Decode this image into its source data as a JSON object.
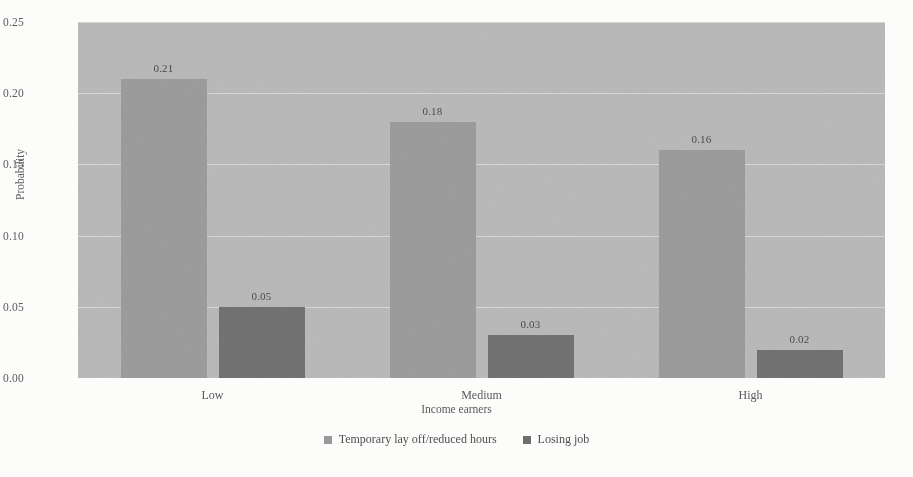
{
  "chart_data": {
    "type": "bar",
    "title": "",
    "subtitle": "",
    "xlabel": "Income earners",
    "ylabel": "Probability",
    "categories": [
      "Low",
      "Medium",
      "High"
    ],
    "series": [
      {
        "name": "Temporary lay off/reduced hours",
        "color": "#9a9a9a",
        "values": [
          0.21,
          0.18,
          0.16
        ],
        "labels": [
          "0.21",
          "0.18",
          "0.16"
        ]
      },
      {
        "name": "Losing job",
        "color": "#6e6e6e",
        "values": [
          0.05,
          0.03,
          0.02
        ],
        "labels": [
          "0.05",
          "0.03",
          "0.02"
        ]
      }
    ],
    "ylim": [
      0.0,
      0.25
    ],
    "ytick_values": [
      0.0,
      0.05,
      0.1,
      0.15,
      0.2,
      0.25
    ],
    "ytick_labels": [
      "0.00",
      "0.05",
      "0.10",
      "0.15",
      "0.20",
      "0.25"
    ],
    "grid": true,
    "legend_position": "bottom",
    "plot_background": "#b9b9b9"
  }
}
